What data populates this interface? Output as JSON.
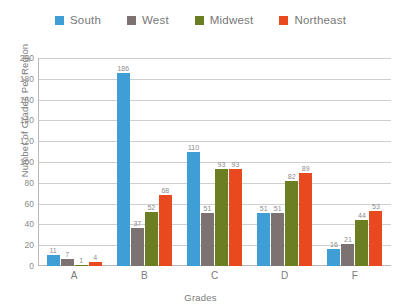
{
  "chart_data": {
    "type": "bar",
    "title": "",
    "xlabel": "Grades",
    "ylabel": "Number of Grades Per Region",
    "categories": [
      "A",
      "B",
      "C",
      "D",
      "F"
    ],
    "ylim": [
      0,
      200
    ],
    "ytick_step": 20,
    "yticks": [
      200,
      180,
      160,
      140,
      120,
      100,
      80,
      60,
      40,
      20,
      0
    ],
    "grid": true,
    "legend_position": "top",
    "series": [
      {
        "name": "South",
        "color": "#3f9ed6",
        "values": [
          11,
          186,
          110,
          51,
          16
        ]
      },
      {
        "name": "West",
        "color": "#7c7272",
        "values": [
          7,
          37,
          51,
          51,
          21
        ]
      },
      {
        "name": "Midwest",
        "color": "#6b7f22",
        "values": [
          1,
          52,
          93,
          82,
          44
        ]
      },
      {
        "name": "Northeast",
        "color": "#e8491f",
        "values": [
          4,
          68,
          93,
          89,
          53
        ]
      }
    ]
  },
  "axis_colors": {
    "gridline": "#cfcfcf",
    "axis_line": "#b9b9b9",
    "text": "#7a7a7a"
  }
}
